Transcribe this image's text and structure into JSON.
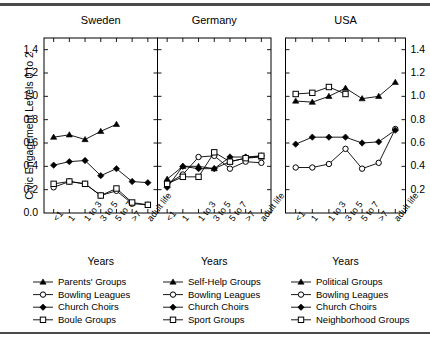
{
  "figure": {
    "y_axis_label": "Civic Engagement Levels 0 to 2",
    "x_axis_label": "Years",
    "y_ticks": [
      "0.0",
      "0.2",
      "0.4",
      "0.6",
      "0.8",
      "1.0",
      "1.2",
      "1.4"
    ],
    "x_ticks": [
      "<1",
      "1",
      "1 to 3",
      "3 to 5",
      "5 to 7",
      ">7",
      "adult life"
    ],
    "panels": [
      "Sweden",
      "Germany",
      "USA"
    ]
  },
  "chart_data": {
    "type": "line",
    "title": "",
    "xlabel": "Years",
    "ylabel": "Civic Engagement Levels 0 to 2",
    "ylim": [
      0.0,
      1.5
    ],
    "yticks": [
      0.0,
      0.2,
      0.4,
      0.6,
      0.8,
      1.0,
      1.2,
      1.4
    ],
    "grid": false,
    "legend_position": "bottom",
    "categories": [
      "<1",
      "1",
      "1 to 3",
      "3 to 5",
      "5 to 7",
      ">7",
      "adult life"
    ],
    "panels": [
      {
        "name": "Sweden",
        "series": [
          {
            "name": "Parents' Groups",
            "marker": "filled-triangle",
            "values": [
              0.65,
              0.67,
              0.63,
              0.7,
              0.76,
              null,
              null
            ]
          },
          {
            "name": "Bowling Leagues",
            "marker": "open-circle",
            "values": [
              0.22,
              0.27,
              0.25,
              0.15,
              0.19,
              0.08,
              0.07
            ]
          },
          {
            "name": "Church Choirs",
            "marker": "filled-diamond",
            "values": [
              0.41,
              0.44,
              0.45,
              0.32,
              0.38,
              0.27,
              0.26
            ]
          },
          {
            "name": "Boule Groups",
            "marker": "open-square",
            "values": [
              0.25,
              0.27,
              0.25,
              0.15,
              0.21,
              0.09,
              0.07
            ]
          }
        ]
      },
      {
        "name": "Germany",
        "series": [
          {
            "name": "Self-Help Groups",
            "marker": "filled-triangle",
            "values": [
              0.29,
              0.4,
              0.4,
              0.38,
              0.44,
              0.47,
              0.48
            ]
          },
          {
            "name": "Bowling Leagues",
            "marker": "open-circle",
            "values": [
              0.25,
              0.33,
              0.48,
              0.49,
              0.38,
              0.44,
              0.43
            ]
          },
          {
            "name": "Church Choirs",
            "marker": "filled-diamond",
            "values": [
              0.22,
              0.4,
              0.38,
              0.38,
              0.48,
              0.48,
              0.49
            ]
          },
          {
            "name": "Sport Groups",
            "marker": "open-square",
            "values": [
              0.25,
              0.31,
              0.31,
              0.52,
              0.44,
              0.47,
              0.49
            ]
          }
        ]
      },
      {
        "name": "USA",
        "series": [
          {
            "name": "Political Groups",
            "marker": "filled-triangle",
            "values": [
              0.96,
              0.95,
              1.0,
              1.07,
              0.98,
              1.0,
              1.12
            ]
          },
          {
            "name": "Bowling Leagues",
            "marker": "open-circle",
            "values": [
              0.39,
              0.39,
              0.42,
              0.55,
              0.38,
              0.43,
              0.72
            ]
          },
          {
            "name": "Church Choirs",
            "marker": "filled-diamond",
            "values": [
              0.59,
              0.65,
              0.65,
              0.65,
              0.6,
              0.61,
              0.71
            ]
          },
          {
            "name": "Neighborhood Groups",
            "marker": "open-square",
            "values": [
              1.02,
              1.03,
              1.08,
              1.02,
              null,
              null,
              null
            ]
          }
        ]
      }
    ]
  },
  "legend": {
    "columns": [
      {
        "panel": "Sweden",
        "items": [
          {
            "label": "Parents' Groups",
            "marker": "filled-triangle"
          },
          {
            "label": "Bowling Leagues",
            "marker": "open-circle"
          },
          {
            "label": "Church Choirs",
            "marker": "filled-diamond"
          },
          {
            "label": "Boule Groups",
            "marker": "open-square"
          }
        ]
      },
      {
        "panel": "Germany",
        "items": [
          {
            "label": "Self-Help Groups",
            "marker": "filled-triangle"
          },
          {
            "label": "Bowling Leagues",
            "marker": "open-circle"
          },
          {
            "label": "Church Choirs",
            "marker": "filled-diamond"
          },
          {
            "label": "Sport Groups",
            "marker": "open-square"
          }
        ]
      },
      {
        "panel": "USA",
        "items": [
          {
            "label": "Political Groups",
            "marker": "filled-triangle"
          },
          {
            "label": "Bowling Leagues",
            "marker": "open-circle"
          },
          {
            "label": "Church Choirs",
            "marker": "filled-diamond"
          },
          {
            "label": "Neighborhood Groups",
            "marker": "open-square"
          }
        ]
      }
    ]
  },
  "colors": {
    "line": "#000000",
    "axis": "#000000",
    "rule": "#4a4a4a",
    "background": "#ffffff"
  }
}
